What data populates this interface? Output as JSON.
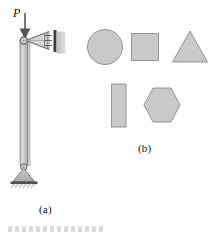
{
  "figure": {
    "title": "",
    "panels": [
      {
        "key": "a",
        "caption": "(a)",
        "description": "column-with-spring-and-pin-support"
      },
      {
        "key": "b",
        "caption": "(b)",
        "description": "cross-section-shapes"
      }
    ],
    "load": {
      "label": "P",
      "direction": "downward",
      "arrow_name": "load-arrow"
    },
    "column": {
      "name": "vertical-column",
      "top_joint": "pin-joint-top",
      "base_support": "pin-support-base",
      "ground": "hatched-ground"
    },
    "spring": {
      "name": "spring-support",
      "wall": "fixed-wall",
      "coils": 3
    },
    "shapes": [
      {
        "name": "circle-section",
        "type": "circle",
        "row": 1
      },
      {
        "name": "square-section",
        "type": "square",
        "row": 1
      },
      {
        "name": "triangle-section",
        "type": "triangle",
        "row": 1
      },
      {
        "name": "rectangle-section",
        "type": "rectangle",
        "row": 2
      },
      {
        "name": "hexagon-section",
        "type": "hexagon",
        "row": 2
      }
    ]
  },
  "colors": {
    "fill_gray": "#c9c9c9",
    "fill_light": "#d4d4d4",
    "outline": "#6e6e6e",
    "dark_outline": "#4a4a4a",
    "ink": "#111111",
    "shadow": "#b6b6b6",
    "background": "#ffffff"
  }
}
